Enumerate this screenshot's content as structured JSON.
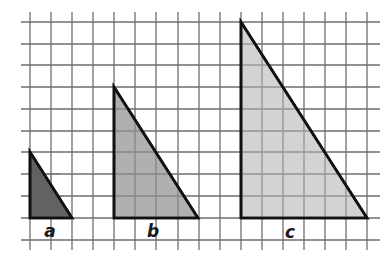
{
  "diagram": {
    "type": "similar-right-triangles-on-grid",
    "grid": {
      "columns": 17,
      "rows": 11,
      "line_color": "#6e6e6e"
    },
    "triangles": [
      {
        "label": "a",
        "base_units": 2,
        "height_units": 3,
        "fill": "#555555",
        "points": "30,152 30,218 72,218",
        "label_x": 50,
        "label_y": 237
      },
      {
        "label": "b",
        "base_units": 4,
        "height_units": 6,
        "fill": "#a9a9a9",
        "points": "114,87 114,218 198,218",
        "label_x": 153,
        "label_y": 237
      },
      {
        "label": "c",
        "base_units": 6,
        "height_units": 9,
        "fill": "#cfcfcf",
        "points": "241,22 241,218 367,218",
        "label_x": 290,
        "label_y": 238
      }
    ]
  }
}
